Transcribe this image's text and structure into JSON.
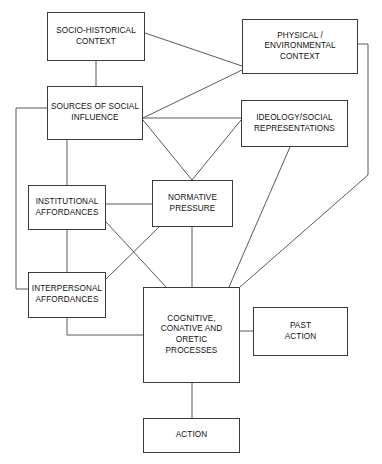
{
  "diagram": {
    "canvas": {
      "width": 382,
      "height": 464
    },
    "style": {
      "background_color": "#ffffff",
      "box_border_color": "#3a3a3a",
      "edge_color": "#5a5a5a",
      "text_color": "#111111"
    },
    "nodes": [
      {
        "id": "socio-historical-context",
        "label": "SOCIO-HISTORICAL\nCONTEXT",
        "x": 47,
        "y": 12,
        "w": 98,
        "h": 49
      },
      {
        "id": "physical-environmental-context",
        "label": "PHYSICAL /\nENVIRONMENTAL\nCONTEXT",
        "x": 242,
        "y": 19,
        "w": 116,
        "h": 55
      },
      {
        "id": "sources-of-social-influence",
        "label": "SOURCES OF SOCIAL\nINFLUENCE",
        "x": 47,
        "y": 86,
        "w": 96,
        "h": 54
      },
      {
        "id": "ideology-social-representations",
        "label": "IDEOLOGY/SOCIAL\nREPRESENTATIONS",
        "x": 241,
        "y": 100,
        "w": 107,
        "h": 47
      },
      {
        "id": "institutional-affordances",
        "label": "INSTITUTIONAL\nAFFORDANCES",
        "x": 28,
        "y": 185,
        "w": 78,
        "h": 45
      },
      {
        "id": "normative-pressure",
        "label": "NORMATIVE\nPRESSURE",
        "x": 152,
        "y": 180,
        "w": 81,
        "h": 47
      },
      {
        "id": "interpersonal-affordances",
        "label": "INTERPERSONAL\nAFFORDANCES",
        "x": 28,
        "y": 272,
        "w": 78,
        "h": 46
      },
      {
        "id": "cognitive-conative-oretic-processes",
        "label": "COGNITIVE,\nCONATIVE AND\nORETIC\nPROCESSES",
        "x": 143,
        "y": 287,
        "w": 97,
        "h": 96
      },
      {
        "id": "past-action",
        "label": "PAST\nACTION",
        "x": 253,
        "y": 307,
        "w": 95,
        "h": 49
      },
      {
        "id": "action",
        "label": "ACTION",
        "x": 143,
        "y": 418,
        "w": 97,
        "h": 35
      }
    ],
    "edges": [
      {
        "id": "socio-historical-to-physical",
        "from": "socio-historical-context",
        "to": "physical-environmental-context",
        "points": "145,33 242,66"
      },
      {
        "id": "socio-historical-to-sources",
        "from": "socio-historical-context",
        "to": "sources-of-social-influence",
        "points": "96,61 96,86"
      },
      {
        "id": "physical-to-sources",
        "from": "physical-environmental-context",
        "to": "sources-of-social-influence",
        "points": "242,70 143,118"
      },
      {
        "id": "physical-to-cognitive",
        "from": "physical-environmental-context",
        "to": "cognitive-conative-oretic-processes",
        "points": "358,44 368,44 368,175 240,287"
      },
      {
        "id": "sources-to-ideology",
        "from": "sources-of-social-influence",
        "to": "ideology-social-representations",
        "points": "143,118 241,118"
      },
      {
        "id": "sources-to-normative",
        "from": "sources-of-social-influence",
        "to": "normative-pressure",
        "points": "143,120 192,180"
      },
      {
        "id": "ideology-to-normative",
        "from": "ideology-social-representations",
        "to": "normative-pressure",
        "points": "241,120 192,180"
      },
      {
        "id": "ideology-to-cognitive",
        "from": "ideology-social-representations",
        "to": "cognitive-conative-oretic-processes",
        "points": "290,147 229,287"
      },
      {
        "id": "sources-to-institutional",
        "from": "sources-of-social-influence",
        "to": "institutional-affordances",
        "points": "67,140 67,185"
      },
      {
        "id": "sources-to-interpersonal",
        "from": "sources-of-social-influence",
        "to": "interpersonal-affordances",
        "points": "47,108 16,108 16,289 28,289"
      },
      {
        "id": "institutional-to-normative",
        "from": "institutional-affordances",
        "to": "normative-pressure",
        "points": "106,204 152,204"
      },
      {
        "id": "institutional-to-interpersonal",
        "from": "institutional-affordances",
        "to": "interpersonal-affordances",
        "points": "67,230 67,272"
      },
      {
        "id": "institutional-to-cognitive",
        "from": "institutional-affordances",
        "to": "cognitive-conative-oretic-processes",
        "points": "106,222 166,287"
      },
      {
        "id": "interpersonal-to-normative",
        "from": "interpersonal-affordances",
        "to": "normative-pressure",
        "points": "106,279 159,227"
      },
      {
        "id": "interpersonal-to-cognitive",
        "from": "interpersonal-affordances",
        "to": "cognitive-conative-oretic-processes",
        "points": "67,318 67,335 143,335"
      },
      {
        "id": "normative-to-cognitive",
        "from": "normative-pressure",
        "to": "cognitive-conative-oretic-processes",
        "points": "192,227 192,287"
      },
      {
        "id": "cognitive-to-past-action",
        "from": "cognitive-conative-oretic-processes",
        "to": "past-action",
        "points": "240,331 253,331"
      },
      {
        "id": "cognitive-to-action",
        "from": "cognitive-conative-oretic-processes",
        "to": "action",
        "points": "192,383 192,418"
      }
    ]
  }
}
